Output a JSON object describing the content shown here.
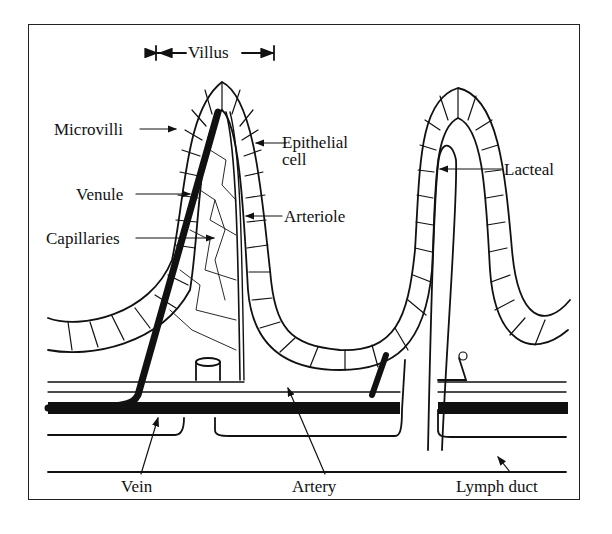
{
  "diagram": {
    "labels": {
      "villus": "Villus",
      "microvilli": "Microvilli",
      "epithelial_cell_line1": "Epithelial",
      "epithelial_cell_line2": "cell",
      "venule": "Venule",
      "arteriole": "Arteriole",
      "capillaries": "Capillaries",
      "lacteal": "Lacteal",
      "vein": "Vein",
      "artery": "Artery",
      "lymph_duct": "Lymph duct"
    },
    "colors": {
      "ink": "#111111",
      "background": "#ffffff"
    }
  }
}
